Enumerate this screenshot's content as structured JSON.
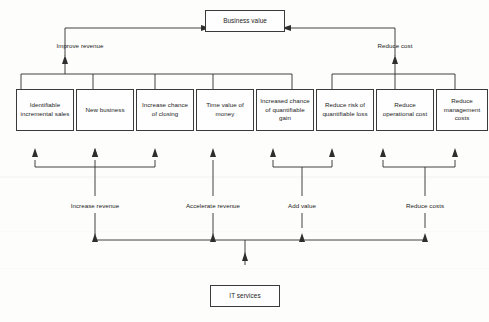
{
  "diagram": {
    "title_box": {
      "label": "Business value"
    },
    "source_box": {
      "label": "IT services"
    },
    "value_drivers": [
      {
        "label": "Improve revenue"
      },
      {
        "label": "Reduce cost"
      }
    ],
    "benefit_boxes": [
      {
        "label": "Identifiable incremental sales"
      },
      {
        "label": "New business"
      },
      {
        "label": "Increase chance of closing"
      },
      {
        "label": "Time value of money"
      },
      {
        "label": "Increased chance of quantifiable gain"
      },
      {
        "label": "Reduce risk of quantifiable loss"
      },
      {
        "label": "Reduce operational cost"
      },
      {
        "label": "Reduce management costs"
      }
    ],
    "service_contributions": [
      {
        "label": "Increase revenue"
      },
      {
        "label": "Accelerate revenue"
      },
      {
        "label": "Add value"
      },
      {
        "label": "Reduce costs"
      }
    ]
  },
  "colors": {
    "ink": "#2e2e2e",
    "box_border": "#3a3a3a",
    "paper": "#fdfdfc"
  }
}
